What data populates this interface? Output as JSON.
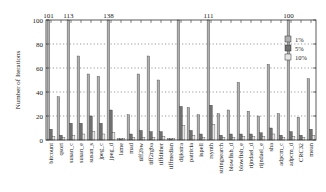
{
  "chart_data": {
    "type": "bar",
    "title": "",
    "xlabel": "",
    "ylabel": "Number of Iterations",
    "ylim": [
      0,
      100
    ],
    "yticks": [
      0,
      20,
      40,
      60,
      80,
      100
    ],
    "grid": "horizontal dotted",
    "legend_position": "upper right (inside)",
    "categories": [
      "bitcount",
      "qsort",
      "susan_c",
      "susan_e",
      "susan_s",
      "jpeg_c",
      "jpeg_d",
      "lame",
      "mad",
      "tiff2bw",
      "tiff2rgba",
      "tiffdither",
      "tiffmedian",
      "dijkstra",
      "patricia",
      "ispell",
      "rsynth",
      "stringsearch",
      "blowfish_d",
      "blowfish_e",
      "rijndael_d",
      "rijndael_e",
      "sha",
      "adpcm_c",
      "adpcm_d",
      "CRC32",
      "mean"
    ],
    "series": [
      {
        "name": "1%",
        "color": "#b0b0b0",
        "values": [
          101,
          36,
          113,
          70,
          55,
          53,
          138,
          1,
          21,
          55,
          70,
          50,
          1,
          138,
          27,
          21,
          111,
          22,
          25,
          48,
          24,
          20,
          63,
          22,
          100,
          19,
          51
        ]
      },
      {
        "name": "5%",
        "color": "#707070",
        "values": [
          9,
          4,
          14,
          14,
          20,
          14,
          25,
          1,
          5,
          8,
          7,
          7,
          1,
          28,
          8,
          5,
          29,
          4,
          5,
          5,
          5,
          6,
          10,
          4,
          7,
          4,
          9
        ]
      },
      {
        "name": "10%",
        "color": "#e6e6e6",
        "values": [
          3,
          2,
          4,
          5,
          7,
          5,
          6,
          1,
          2,
          2,
          2,
          3,
          1,
          12,
          4,
          2,
          13,
          2,
          2,
          3,
          3,
          3,
          5,
          2,
          3,
          2,
          4
        ]
      }
    ],
    "clipped_value_labels": [
      {
        "category": "bitcount",
        "series": "1%",
        "label": "101"
      },
      {
        "category": "susan_c",
        "series": "1%",
        "label": "113"
      },
      {
        "category": "jpeg_d",
        "series": "1%",
        "label": "138"
      },
      {
        "category": "rsynth",
        "series": "1%",
        "label": "111"
      },
      {
        "category": "adpcm_d",
        "series": "1%",
        "label": "100"
      }
    ]
  }
}
